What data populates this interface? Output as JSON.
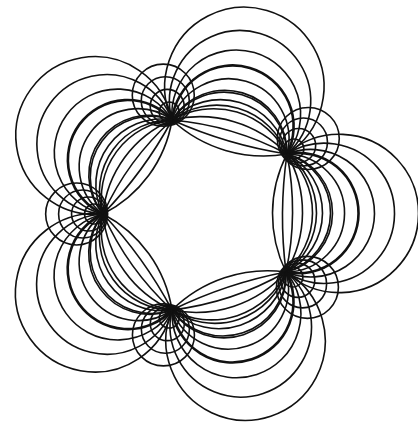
{
  "figure": {
    "width": 418,
    "height": 425,
    "background": "#ffffff",
    "stroke_color": "#111111",
    "stroke_width": 1.6,
    "bold_stroke_width": 2.6,
    "center": [
      205,
      214
    ],
    "nodes": [
      [
        172,
        120
      ],
      [
        287,
        154
      ],
      [
        286,
        272
      ],
      [
        172,
        310
      ],
      [
        103,
        214
      ]
    ],
    "arc_family": {
      "count_per_side": 7,
      "bold_index": 3,
      "outer_bulges": [
        30,
        44,
        58,
        72,
        88,
        108,
        132
      ],
      "inner_bulges": [
        -14,
        -4,
        6,
        16,
        26,
        36,
        46
      ]
    }
  }
}
